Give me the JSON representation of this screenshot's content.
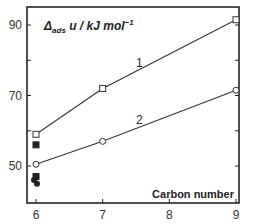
{
  "chart_data": {
    "type": "line",
    "title": "",
    "ylabel": "Δads u / kJ mol⁻¹",
    "ylabel_parts": {
      "delta": "Δ",
      "sub": "ads",
      "rest": " u / kJ mol",
      "sup": "−1"
    },
    "xlabel": "Carbon number",
    "xlim": [
      5.87,
      9.05
    ],
    "ylim": [
      42,
      95
    ],
    "xticks": [
      6,
      7,
      8,
      9
    ],
    "yticks_labeled": [
      50,
      70,
      90
    ],
    "yticks_minor": [
      60,
      80
    ],
    "grid": false,
    "legend": "none (inline series labels)",
    "series": [
      {
        "name": "1",
        "marker": "open-square",
        "x": [
          6,
          7,
          9
        ],
        "y": [
          59,
          72,
          91.5
        ]
      },
      {
        "name": "2",
        "marker": "open-circle",
        "x": [
          6,
          7,
          9
        ],
        "y": [
          50.5,
          57,
          71.5
        ]
      }
    ],
    "extra_points": [
      {
        "marker": "filled-square",
        "x": 6,
        "y": 56
      },
      {
        "marker": "filled-square",
        "x": 6,
        "y": 47
      },
      {
        "marker": "filled-circle",
        "x": 6,
        "y": 46
      },
      {
        "marker": "filled-circle",
        "x": 6,
        "y": 45
      }
    ],
    "annotations": [
      {
        "text": "1",
        "x": 7.55,
        "y": 78
      },
      {
        "text": "2",
        "x": 7.55,
        "y": 62
      }
    ]
  }
}
